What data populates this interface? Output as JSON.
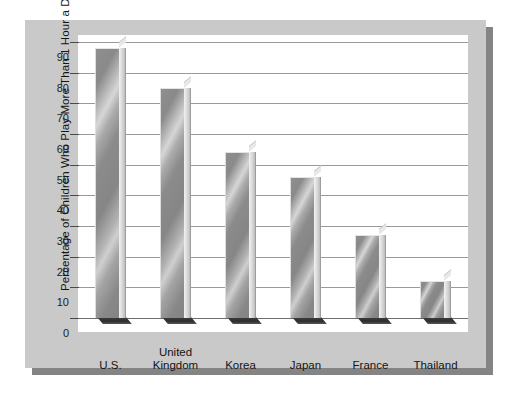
{
  "chart_data": {
    "type": "bar",
    "title": "",
    "xlabel": "",
    "ylabel": "Percentage of Children Who Play More Than 1 Hour a Day",
    "categories": [
      "U.S.",
      "United Kingdom",
      "Korea",
      "Japan",
      "France",
      "Thailand"
    ],
    "category_lines": [
      [
        "U.S."
      ],
      [
        "United",
        "Kingdom"
      ],
      [
        "Korea"
      ],
      [
        "Japan"
      ],
      [
        "France"
      ],
      [
        "Thailand"
      ]
    ],
    "values": [
      88,
      75,
      54,
      46,
      27,
      12
    ],
    "ylim": [
      0,
      90
    ],
    "ytick_step": 10,
    "yticks": [
      90,
      80,
      70,
      60,
      50,
      40,
      30,
      20,
      10,
      0
    ],
    "ytick_labels": [
      "90",
      "80",
      "70",
      "60",
      "50",
      "40",
      "30",
      "20",
      "10",
      "0"
    ],
    "grid": true,
    "legend": false,
    "legend_position": "none",
    "style": "3d-bar",
    "colors": {
      "page_background": "#ffffff",
      "card_background": "#c9c9c9",
      "card_shadow": "#848484",
      "plot_background": "#ffffff",
      "gridline": "#9a9a9a",
      "baseline": "#6e6e6e",
      "bar_face_light": "#d6d6d6",
      "bar_face_dark": "#858585",
      "bar_side": "#d8d8d8",
      "bar_base_shadow": "#333333",
      "text": "#141414"
    }
  }
}
